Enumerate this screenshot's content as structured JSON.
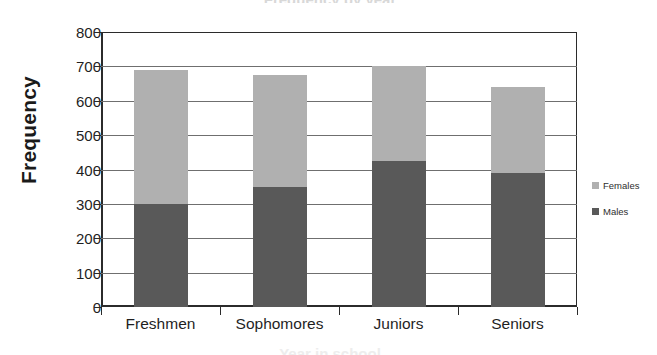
{
  "chart_data": {
    "type": "bar",
    "subtype": "stacked-bar",
    "title": "",
    "xlabel": "",
    "ylabel": "Frequency",
    "categories": [
      "Freshmen",
      "Sophomores",
      "Juniors",
      "Seniors"
    ],
    "series": [
      {
        "name": "Males",
        "color": "#595959",
        "values": [
          300,
          350,
          425,
          390
        ]
      },
      {
        "name": "Females",
        "color": "#b0b0b0",
        "values": [
          390,
          325,
          275,
          250
        ]
      }
    ],
    "totals": [
      690,
      675,
      700,
      640
    ],
    "ylim": [
      0,
      800
    ],
    "ytick_step": 100,
    "yticks": [
      "800",
      "700",
      "600",
      "500",
      "400",
      "300",
      "200",
      "100",
      "0"
    ],
    "grid": true,
    "legend_position": "right",
    "legend_entries": [
      "Females",
      "Males"
    ]
  },
  "axis": {
    "y_title": "Frequency",
    "x_title_cut_off": "Year in school",
    "top_title_cut_off": "Frequency by year"
  },
  "legend": {
    "items": [
      {
        "label": "Females",
        "color": "#b0b0b0"
      },
      {
        "label": "Males",
        "color": "#595959"
      }
    ]
  }
}
